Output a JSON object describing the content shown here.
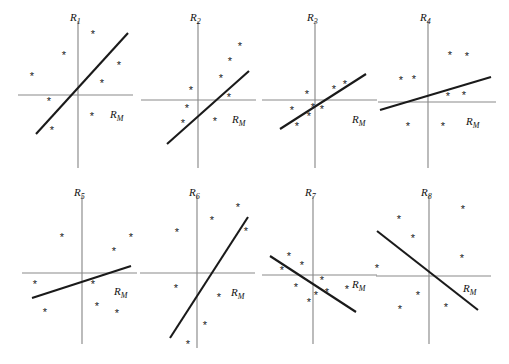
{
  "figure": {
    "title": "",
    "background": "#ffffff",
    "line_color": "#1a1a1a",
    "axis_color": "#8a8a8a",
    "marker_glyph": "*",
    "rows": 2,
    "cols": 4
  },
  "chart_data": {
    "type": "scatter",
    "title": "",
    "xlabel": "R_M",
    "ylabel": "R_i",
    "grid": false,
    "legend": null,
    "panels": [
      {
        "id": "panel-1",
        "ylabel": "R",
        "ylabel_sub": "1",
        "xlabel": "R",
        "xlabel_sub": "M",
        "origin": [
          78,
          95
        ],
        "xaxis": [
          18,
          133
        ],
        "yaxis": [
          21,
          168
        ],
        "ylabel_pos": [
          70,
          21
        ],
        "xlabel_pos": [
          110,
          118
        ],
        "fit_line": [
          [
            36,
            134
          ],
          [
            128,
            33
          ]
        ],
        "points": [
          [
            93,
            35
          ],
          [
            64,
            56
          ],
          [
            119,
            66
          ],
          [
            32,
            77
          ],
          [
            102,
            84
          ],
          [
            49,
            102
          ],
          [
            92,
            117
          ],
          [
            52,
            131
          ]
        ]
      },
      {
        "id": "panel-2",
        "ylabel": "R",
        "ylabel_sub": "2",
        "xlabel": "R",
        "xlabel_sub": "M",
        "origin": [
          198,
          100
        ],
        "xaxis": [
          141,
          256
        ],
        "yaxis": [
          21,
          168
        ],
        "ylabel_pos": [
          190,
          21
        ],
        "xlabel_pos": [
          232,
          123
        ],
        "fit_line": [
          [
            167,
            144
          ],
          [
            249,
            71
          ]
        ],
        "points": [
          [
            240,
            47
          ],
          [
            230,
            62
          ],
          [
            221,
            79
          ],
          [
            191,
            91
          ],
          [
            229,
            98
          ],
          [
            187,
            109
          ],
          [
            215,
            122
          ],
          [
            183,
            124
          ]
        ]
      },
      {
        "id": "panel-3",
        "ylabel": "R",
        "ylabel_sub": "3",
        "xlabel": "R",
        "xlabel_sub": "M",
        "origin": [
          315,
          100
        ],
        "xaxis": [
          262,
          377
        ],
        "yaxis": [
          21,
          168
        ],
        "ylabel_pos": [
          307,
          21
        ],
        "xlabel_pos": [
          352,
          123
        ],
        "fit_line": [
          [
            280,
            129
          ],
          [
            366,
            74
          ]
        ],
        "points": [
          [
            345,
            85
          ],
          [
            334,
            90
          ],
          [
            307,
            95
          ],
          [
            322,
            110
          ],
          [
            313,
            108
          ],
          [
            292,
            111
          ],
          [
            309,
            117
          ],
          [
            297,
            127
          ]
        ]
      },
      {
        "id": "panel-4",
        "ylabel": "R",
        "ylabel_sub": "4",
        "xlabel": "R",
        "xlabel_sub": "M",
        "origin": [
          428,
          102
        ],
        "xaxis": [
          378,
          496
        ],
        "yaxis": [
          21,
          168
        ],
        "ylabel_pos": [
          420,
          21
        ],
        "xlabel_pos": [
          466,
          125
        ],
        "fit_line": [
          [
            380,
            110
          ],
          [
            491,
            77
          ]
        ],
        "points": [
          [
            450,
            56
          ],
          [
            467,
            57
          ],
          [
            401,
            81
          ],
          [
            414,
            80
          ],
          [
            448,
            97
          ],
          [
            464,
            96
          ],
          [
            408,
            127
          ],
          [
            443,
            127
          ]
        ]
      },
      {
        "id": "panel-5",
        "ylabel": "R",
        "ylabel_sub": "5",
        "xlabel": "R",
        "xlabel_sub": "M",
        "origin": [
          82,
          273
        ],
        "xaxis": [
          22,
          137
        ],
        "yaxis": [
          196,
          344
        ],
        "ylabel_pos": [
          74,
          196
        ],
        "xlabel_pos": [
          114,
          295
        ],
        "fit_line": [
          [
            32,
            298
          ],
          [
            131,
            266
          ]
        ],
        "points": [
          [
            62,
            238
          ],
          [
            131,
            238
          ],
          [
            114,
            252
          ],
          [
            35,
            285
          ],
          [
            93,
            285
          ],
          [
            45,
            313
          ],
          [
            97,
            307
          ],
          [
            117,
            314
          ]
        ]
      },
      {
        "id": "panel-6",
        "ylabel": "R",
        "ylabel_sub": "6",
        "xlabel": "R",
        "xlabel_sub": "M",
        "origin": [
          197,
          273
        ],
        "xaxis": [
          140,
          255
        ],
        "yaxis": [
          196,
          348
        ],
        "ylabel_pos": [
          189,
          196
        ],
        "xlabel_pos": [
          231,
          296
        ],
        "fit_line": [
          [
            170,
            338
          ],
          [
            248,
            217
          ]
        ],
        "points": [
          [
            238,
            208
          ],
          [
            212,
            221
          ],
          [
            177,
            233
          ],
          [
            246,
            232
          ],
          [
            176,
            289
          ],
          [
            219,
            298
          ],
          [
            205,
            326
          ],
          [
            188,
            345
          ]
        ]
      },
      {
        "id": "panel-7",
        "ylabel": "R",
        "ylabel_sub": "7",
        "xlabel": "R",
        "xlabel_sub": "M",
        "origin": [
          313,
          275
        ],
        "xaxis": [
          262,
          377
        ],
        "yaxis": [
          196,
          344
        ],
        "ylabel_pos": [
          305,
          196
        ],
        "xlabel_pos": [
          352,
          288
        ],
        "fit_line": [
          [
            270,
            256
          ],
          [
            356,
            312
          ]
        ],
        "points": [
          [
            289,
            257
          ],
          [
            282,
            271
          ],
          [
            302,
            266
          ],
          [
            322,
            281
          ],
          [
            296,
            288
          ],
          [
            316,
            296
          ],
          [
            327,
            293
          ],
          [
            309,
            303
          ],
          [
            347,
            290
          ]
        ]
      },
      {
        "id": "panel-8",
        "ylabel": "R",
        "ylabel_sub": "8",
        "xlabel": "R",
        "xlabel_sub": "M",
        "origin": [
          429,
          276
        ],
        "xaxis": [
          376,
          491
        ],
        "yaxis": [
          196,
          344
        ],
        "ylabel_pos": [
          421,
          196
        ],
        "xlabel_pos": [
          463,
          292
        ],
        "fit_line": [
          [
            377,
            231
          ],
          [
            478,
            310
          ]
        ],
        "points": [
          [
            399,
            220
          ],
          [
            463,
            210
          ],
          [
            413,
            239
          ],
          [
            462,
            259
          ],
          [
            377,
            269
          ],
          [
            418,
            296
          ],
          [
            400,
            310
          ],
          [
            446,
            308
          ]
        ]
      }
    ]
  }
}
